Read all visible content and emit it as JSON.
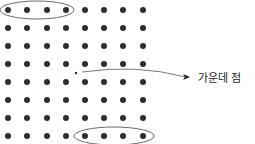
{
  "diagram": {
    "type": "dot-grid",
    "rows": 8,
    "cols": 8,
    "dot_color": "#2e2e2e",
    "line_color": "#6a6a6a",
    "col_x": [
      8,
      27,
      47,
      66,
      85,
      104,
      123,
      143
    ],
    "row_y": [
      10,
      28,
      46,
      64,
      82,
      100,
      118,
      136
    ],
    "dot_radius": 3,
    "highlight_groups": [
      {
        "name": "top-left-row-group",
        "row": 0,
        "cols": [
          0,
          1,
          2,
          3
        ]
      },
      {
        "name": "bottom-right-row-group",
        "row": 7,
        "cols": [
          4,
          5,
          6,
          7
        ]
      }
    ],
    "center_point": {
      "x": 76,
      "y": 73,
      "radius": 1.2
    },
    "annotation": {
      "label": "가운데 점",
      "arrow_from": [
        82,
        72
      ],
      "arrow_to": [
        190,
        77
      ]
    }
  }
}
